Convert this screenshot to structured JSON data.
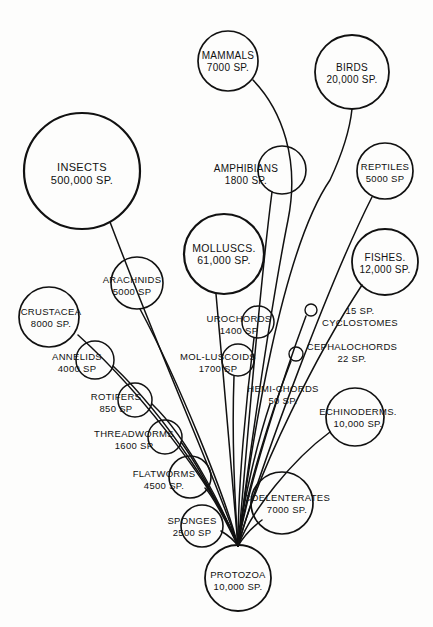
{
  "diagram": {
    "type": "bubble-tree",
    "background_color": "#fdfdfc",
    "ink_color": "#111111",
    "root_name": "PROTOZOA",
    "convergence_point": {
      "x": 238,
      "y": 546
    }
  },
  "chart_data": {
    "type": "bubble-tree",
    "xlabel": "",
    "ylabel": "",
    "unit_label": "SP.",
    "root": "PROTOZOA",
    "categories": [
      "INSECTS",
      "MAMMALS",
      "BIRDS",
      "REPTILES",
      "AMPHIBIANS",
      "FISHES",
      "MOLLUSCS.",
      "ARACHNIDS",
      "CRUSTACEA",
      "ANNELIDS",
      "ROTIFERS",
      "THREADWORMS",
      "FLATWORMS",
      "SPONGES",
      "COELENTERATES",
      "PROTOZOA",
      "ECHINODERMS.",
      "UROCHORDS",
      "MOL-LUSCOIDS",
      "HEMI-CHORDS",
      "CEPHALOCHORDS",
      "CYCLOSTOMES"
    ],
    "values": [
      500000,
      7000,
      20000,
      5000,
      1800,
      12000,
      61000,
      5000,
      8000,
      4000,
      850,
      1600,
      4500,
      2500,
      7000,
      10000,
      10000,
      1400,
      1700,
      50,
      22,
      15
    ]
  },
  "nodes": [
    {
      "id": "insects",
      "name": "INSECTS",
      "line1": "INSECTS",
      "line2": "500,000 SP.",
      "species": 500000,
      "cx": 82,
      "cy": 171,
      "r": 58,
      "stroke_width": 2.2,
      "font_size": 11,
      "text_x": 82,
      "text_y": 171,
      "label_inside": true
    },
    {
      "id": "mammals",
      "name": "MAMMALS",
      "line1": "MAMMALS",
      "line2": "7000 SP.",
      "species": 7000,
      "cx": 228,
      "cy": 61,
      "r": 30,
      "stroke_width": 1.7,
      "font_size": 10,
      "text_x": 228,
      "text_y": 59,
      "label_inside": true
    },
    {
      "id": "birds",
      "name": "BIRDS",
      "line1": "BIRDS",
      "line2": "20,000 SP.",
      "species": 20000,
      "cx": 352,
      "cy": 72,
      "r": 37,
      "stroke_width": 1.8,
      "font_size": 10,
      "text_x": 352,
      "text_y": 71,
      "label_inside": true
    },
    {
      "id": "reptiles",
      "name": "REPTILES",
      "line1": "REPTILES",
      "line2": "5000 SP",
      "species": 5000,
      "cx": 385,
      "cy": 171,
      "r": 28,
      "stroke_width": 1.7,
      "font_size": 9.5,
      "text_x": 385,
      "text_y": 170,
      "label_inside": true
    },
    {
      "id": "amphibians",
      "name": "AMPHIBIANS",
      "line1": "AMPHIBIANS",
      "line2": "1800 SP.",
      "species": 1800,
      "cx": 282,
      "cy": 170,
      "r": 24,
      "stroke_width": 1.6,
      "font_size": 10,
      "text_x": 246,
      "text_y": 172,
      "label_inside": false
    },
    {
      "id": "fishes",
      "name": "FISHES.",
      "line1": "FISHES.",
      "line2": "12,000 SP.",
      "species": 12000,
      "cx": 385,
      "cy": 262,
      "r": 33,
      "stroke_width": 1.8,
      "font_size": 10,
      "text_x": 385,
      "text_y": 261,
      "label_inside": true
    },
    {
      "id": "molluscs",
      "name": "MOLLUSCS.",
      "line1": "MOLLUSCS.",
      "line2": "61,000 SP.",
      "species": 61000,
      "cx": 224,
      "cy": 254,
      "r": 40,
      "stroke_width": 2.2,
      "font_size": 10.5,
      "text_x": 224,
      "text_y": 252,
      "label_inside": true
    },
    {
      "id": "arachnids",
      "name": "ARACHNIDS",
      "line1": "ARACHNIDS",
      "line2": "5000 SP",
      "species": 5000,
      "cx": 137,
      "cy": 283,
      "r": 26,
      "stroke_width": 1.6,
      "font_size": 9.5,
      "text_x": 132,
      "text_y": 283,
      "label_inside": true
    },
    {
      "id": "crustacea",
      "name": "CRUSTACEA",
      "line1": "CRUSTACEA",
      "line2": "8000 SP.",
      "species": 8000,
      "cx": 49,
      "cy": 317,
      "r": 30,
      "stroke_width": 1.7,
      "font_size": 9.5,
      "text_x": 51,
      "text_y": 315,
      "label_inside": true
    },
    {
      "id": "annelids",
      "name": "ANNELIDS",
      "line1": "ANNELIDS",
      "line2": "4000 SP",
      "species": 4000,
      "cx": 95,
      "cy": 360,
      "r": 19,
      "stroke_width": 1.5,
      "font_size": 9.5,
      "text_x": 77,
      "text_y": 360,
      "label_inside": false
    },
    {
      "id": "rotifers",
      "name": "ROTIFERS",
      "line1": "ROTIFERS",
      "line2": "850 SP",
      "species": 850,
      "cx": 135,
      "cy": 400,
      "r": 17,
      "stroke_width": 1.5,
      "font_size": 9.5,
      "text_x": 116,
      "text_y": 400,
      "label_inside": false
    },
    {
      "id": "threadworms",
      "name": "THREADWORMS",
      "line1": "THREADWORMS",
      "line2": "1600 SP",
      "species": 1600,
      "cx": 165,
      "cy": 437,
      "r": 17,
      "stroke_width": 1.5,
      "font_size": 9.5,
      "text_x": 134,
      "text_y": 437,
      "label_inside": false
    },
    {
      "id": "flatworms",
      "name": "FLATWORMS",
      "line1": "FLATWORMS",
      "line2": "4500 SP.",
      "species": 4500,
      "cx": 190,
      "cy": 477,
      "r": 21,
      "stroke_width": 1.6,
      "font_size": 9.5,
      "text_x": 164,
      "text_y": 477,
      "label_inside": false
    },
    {
      "id": "sponges",
      "name": "SPONGES",
      "line1": "SPONGES",
      "line2": "2500 SP",
      "species": 2500,
      "cx": 202,
      "cy": 526,
      "r": 21,
      "stroke_width": 1.6,
      "font_size": 9.5,
      "text_x": 192,
      "text_y": 524,
      "label_inside": true
    },
    {
      "id": "coelenterates",
      "name": "COELENTERATES",
      "line1": "COELENTERATES",
      "line2": "7000 SP.",
      "species": 7000,
      "cx": 282,
      "cy": 503,
      "r": 31,
      "stroke_width": 1.7,
      "font_size": 9.5,
      "text_x": 287,
      "text_y": 501,
      "label_inside": true
    },
    {
      "id": "protozoa",
      "name": "PROTOZOA",
      "line1": "PROTOZOA",
      "line2": "10,000 SP.",
      "species": 10000,
      "cx": 238,
      "cy": 578,
      "r": 33,
      "stroke_width": 1.8,
      "font_size": 9.5,
      "text_x": 238,
      "text_y": 578,
      "label_inside": true
    },
    {
      "id": "echinoderms",
      "name": "ECHINODERMS.",
      "line1": "ECHINODERMS.",
      "line2": "10,000 SP.",
      "species": 10000,
      "cx": 355,
      "cy": 417,
      "r": 29,
      "stroke_width": 1.7,
      "font_size": 9.5,
      "text_x": 358,
      "text_y": 415,
      "label_inside": true
    },
    {
      "id": "urochords",
      "name": "UROCHORDS",
      "line1": "UROCHORDS",
      "line2": "1400 SP",
      "species": 1400,
      "cx": 258,
      "cy": 322,
      "r": 16,
      "stroke_width": 1.5,
      "font_size": 9.5,
      "text_x": 239,
      "text_y": 322,
      "label_inside": false
    },
    {
      "id": "molluscoids",
      "name": "MOL-LUSCOIDS",
      "line1": "MOL-LUSCOIDS",
      "line2": "1700 SP",
      "species": 1700,
      "cx": 238,
      "cy": 360,
      "r": 16,
      "stroke_width": 1.5,
      "font_size": 9.5,
      "text_x": 218,
      "text_y": 360,
      "label_inside": false
    },
    {
      "id": "hemichords",
      "name": "HEMI-CHORDS",
      "line1": "HEMI-CHORDS",
      "line2": "50 SP.",
      "species": 50,
      "cx": 283,
      "cy": 395,
      "r": 0,
      "stroke_width": 0,
      "font_size": 9.5,
      "text_x": 283,
      "text_y": 392,
      "label_inside": false
    },
    {
      "id": "cephalochords",
      "name": "CEPHALOCHORDS",
      "line1": "CEPHALOCHORDS",
      "line2": "22 SP.",
      "species": 22,
      "cx": 296,
      "cy": 354,
      "r": 7,
      "stroke_width": 1.4,
      "font_size": 9.5,
      "text_x": 352,
      "text_y": 350,
      "label_inside": false
    },
    {
      "id": "cyclostomes",
      "name": "CYCLOSTOMES",
      "line1": "15 SP.",
      "line2": "CYCLOSTOMES",
      "species": 15,
      "cx": 311,
      "cy": 310,
      "r": 6,
      "stroke_width": 1.4,
      "font_size": 9.5,
      "text_x": 360,
      "text_y": 314,
      "label_inside": false
    }
  ],
  "branches": [
    {
      "id": "branch-insects",
      "target": "INSECTS",
      "path": "M 238 546 C 225 500 170 380 110 222"
    },
    {
      "id": "branch-arachnids",
      "target": "ARACHNIDS",
      "path": "M 238 546 C 226 498 178 380 140 309"
    },
    {
      "id": "branch-crustacea",
      "target": "CRUSTACEA",
      "path": "M 238 546 C 222 500 150 400 78 335"
    },
    {
      "id": "branch-annelids",
      "target": "ANNELIDS",
      "path": "M 238 546 C 224 508 170 420 113 366"
    },
    {
      "id": "branch-rotifers",
      "target": "ROTIFERS",
      "path": "M 238 546 C 226 516 190 440 152 404"
    },
    {
      "id": "branch-threadworms",
      "target": "THREADWORMS",
      "path": "M 238 546 C 228 522 200 468 181 442"
    },
    {
      "id": "branch-flatworms",
      "target": "FLATWORMS",
      "path": "M 238 546 C 230 530 215 498 205 488"
    },
    {
      "id": "branch-sponges",
      "target": "SPONGES",
      "path": "M 238 546 C 234 540 226 534 221 531"
    },
    {
      "id": "branch-coelenterates",
      "target": "COELENTERATES",
      "path": "M 238 546 C 244 536 254 526 262 520"
    },
    {
      "id": "branch-molluscs",
      "target": "MOLLUSCS.",
      "path": "M 238 546 C 232 480 224 380 216 294"
    },
    {
      "id": "branch-molluscoids",
      "target": "MOL-LUSCOIDS",
      "path": "M 238 546 C 234 490 232 430 234 376"
    },
    {
      "id": "branch-urochords",
      "target": "UROCHORDS",
      "path": "M 238 546 C 238 486 246 400 254 338"
    },
    {
      "id": "branch-hemichords",
      "target": "HEMI-CHORDS",
      "path": "M 238 546 C 243 500 258 440 270 404"
    },
    {
      "id": "branch-cephalochords",
      "target": "CEPHALOCHORDS",
      "path": "M 238 546 C 245 494 272 410 291 361"
    },
    {
      "id": "branch-cyclostomes",
      "target": "CYCLOSTOMES",
      "path": "M 238 546 C 248 486 284 375 306 316"
    },
    {
      "id": "branch-echinoderms",
      "target": "ECHINODERMS.",
      "path": "M 238 546 C 252 510 292 460 330 432"
    },
    {
      "id": "branch-fishes",
      "target": "FISHES.",
      "path": "M 238 546 C 258 470 318 352 362 285"
    },
    {
      "id": "branch-amphibians",
      "target": "AMPHIBIANS",
      "path": "M 238 546 C 246 460 258 300 272 192"
    },
    {
      "id": "branch-reptiles",
      "target": "REPTILES",
      "path": "M 238 546 C 262 462 330 280 372 197"
    },
    {
      "id": "branch-birds",
      "target": "BIRDS",
      "path": "M 238 546 C 252 440 282 250 330 180 C 344 150 350 128 352 109"
    },
    {
      "id": "branch-mammals",
      "target": "MAMMALS",
      "path": "M 238 546 C 250 450 272 300 288 220 C 300 160 282 110 253 80"
    },
    {
      "id": "branch-protozoa",
      "target": "PROTOZOA",
      "path": "M 238 546 L 238 546"
    }
  ]
}
